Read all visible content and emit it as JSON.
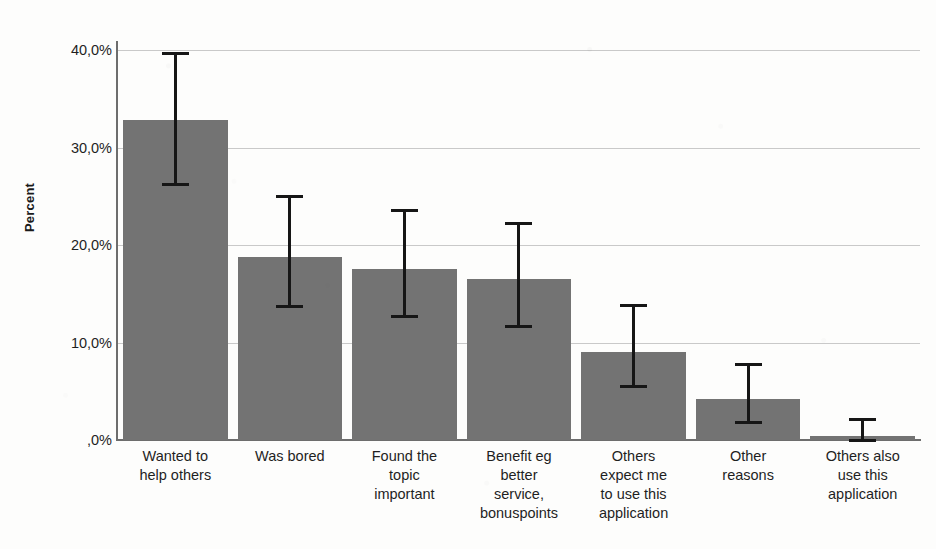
{
  "chart_data": {
    "type": "bar",
    "title": "",
    "xlabel": "",
    "ylabel": "Percent",
    "ylim": [
      0,
      40
    ],
    "grid": true,
    "legend": null,
    "decimal_separator": ",",
    "error_bars": "95% CI",
    "categories": [
      "Wanted to help others",
      "Was bored",
      "Found the topic important",
      "Benefit eg better service, bonuspoints",
      "Others expect me to use this application",
      "Other reasons",
      "Others also use this application"
    ],
    "category_lines": [
      [
        "Wanted to",
        "help others"
      ],
      [
        "Was bored"
      ],
      [
        "Found the",
        "topic",
        "important"
      ],
      [
        "Benefit eg",
        "better",
        "service,",
        "bonuspoints"
      ],
      [
        "Others",
        "expect me",
        "to use this",
        "application"
      ],
      [
        "Other",
        "reasons"
      ],
      [
        "Others also",
        "use this",
        "application"
      ]
    ],
    "values": [
      32.8,
      18.8,
      17.5,
      16.5,
      9.0,
      4.2,
      0.4
    ],
    "error_low": [
      26.3,
      13.7,
      12.7,
      11.7,
      5.5,
      1.8,
      0.0
    ],
    "error_high": [
      39.7,
      25.0,
      23.6,
      22.3,
      13.8,
      7.8,
      2.2
    ],
    "y_ticks": [
      0,
      10,
      20,
      30,
      40
    ],
    "y_tick_labels": [
      ",0%",
      "10,0%",
      "20,0%",
      "30,0%",
      "40,0%"
    ],
    "colors": {
      "bar_fill": "#737373",
      "error_bar": "#161616",
      "gridline": "#c9c9c9",
      "axis": "#6d6d6d",
      "background": "#fdfdfc",
      "text": "#1f1f1f"
    }
  }
}
